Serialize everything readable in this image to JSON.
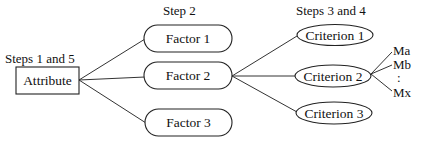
{
  "diagram": {
    "step_labels": {
      "attribute_steps": "Steps 1 and 5",
      "factor_steps": "Step 2",
      "criterion_steps": "Steps 3 and 4"
    },
    "root": {
      "label": "Attribute",
      "shape": "rectangle"
    },
    "factors": [
      {
        "label": "Factor 1",
        "shape": "rounded-pill"
      },
      {
        "label": "Factor 2",
        "shape": "rounded-pill"
      },
      {
        "label": "Factor 3",
        "shape": "rounded-pill"
      }
    ],
    "criteria": [
      {
        "label": "Criterion 1",
        "shape": "ellipse",
        "parent": "Factor 2"
      },
      {
        "label": "Criterion 2",
        "shape": "ellipse",
        "parent": "Factor 2"
      },
      {
        "label": "Criterion 3",
        "shape": "ellipse",
        "parent": "Factor 2"
      }
    ],
    "measures": {
      "parent": "Criterion 2",
      "items": [
        "Ma",
        "Mb",
        "Mx"
      ],
      "ellipsis": ":"
    },
    "edges": [
      [
        "Attribute",
        "Factor 1"
      ],
      [
        "Attribute",
        "Factor 2"
      ],
      [
        "Attribute",
        "Factor 3"
      ],
      [
        "Factor 2",
        "Criterion 1"
      ],
      [
        "Factor 2",
        "Criterion 2"
      ],
      [
        "Factor 2",
        "Criterion 3"
      ],
      [
        "Criterion 2",
        "Ma"
      ],
      [
        "Criterion 2",
        "Mb"
      ],
      [
        "Criterion 2",
        "Mx"
      ]
    ]
  }
}
